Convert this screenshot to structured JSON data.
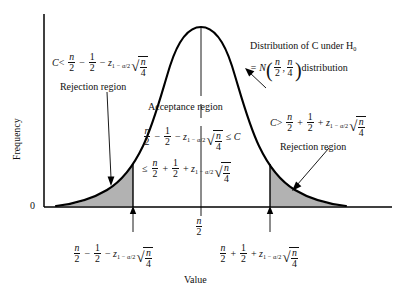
{
  "figure": {
    "type": "annotated-normal-distribution",
    "axes": {
      "y_label": "Frequency",
      "x_label": "Value",
      "origin_label": "0"
    },
    "curve": {
      "shape": "normal",
      "mean_label": "n/2",
      "center_x": 201,
      "peak_y": 27,
      "baseline_y": 207
    },
    "regions": {
      "left_boundary_x": 133,
      "right_boundary_x": 270,
      "shaded_fill": "#b0b0b0",
      "stroke": "#000000"
    }
  },
  "annotations": {
    "left_rejection": {
      "name": "left-rejection-annotation",
      "condition_prefix": "C <",
      "label": "Rejection region"
    },
    "right_rejection": {
      "name": "right-rejection-annotation",
      "condition_prefix": "C >",
      "label": "Rejection region"
    },
    "acceptance": {
      "name": "acceptance-annotation",
      "label": "Acceptance region"
    },
    "distribution": {
      "line1": "Distribution of C under H",
      "line1_sub": "0",
      "line2_prefix": "= N",
      "line2_suffix": "distribution"
    }
  },
  "math": {
    "n": "n",
    "two": "2",
    "one": "1",
    "four": "4",
    "z": "z",
    "z_sub": "1 − α/2",
    "C": "C",
    "minus": "−",
    "plus": "+",
    "le": "≤",
    "lt": "<",
    "gt": ">",
    "comma": ","
  },
  "ticks": {
    "center": {
      "name": "tick-center",
      "x": 201
    },
    "left": {
      "name": "tick-left-critical",
      "x": 133
    },
    "right": {
      "name": "tick-right-critical",
      "x": 270
    }
  }
}
